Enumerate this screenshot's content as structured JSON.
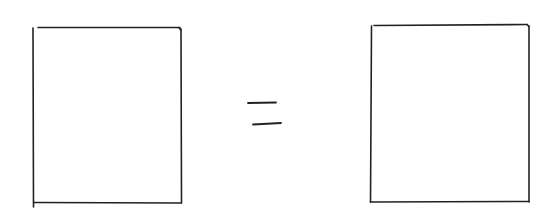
{
  "diagram": {
    "stroke_color": "#222222",
    "background": "#ffffff",
    "shapes": {
      "left_rectangle": {
        "x": 33,
        "y": 27,
        "width": 148,
        "height": 176
      },
      "equals_sign": {
        "top_line": {
          "x1": 248,
          "y1": 103,
          "x2": 276,
          "y2": 102
        },
        "bottom_line": {
          "x1": 253,
          "y1": 124,
          "x2": 281,
          "y2": 123
        }
      },
      "right_rectangle": {
        "x": 371,
        "y": 25,
        "width": 158,
        "height": 177
      }
    }
  }
}
